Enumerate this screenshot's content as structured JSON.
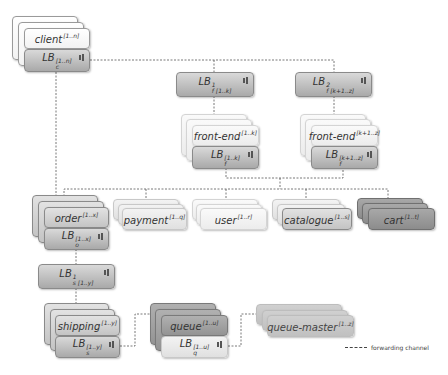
{
  "diagram": {
    "nodes": {
      "client": {
        "name": "client",
        "sup": "[1..n]"
      },
      "lb_client": {
        "name": "LB",
        "sup": "[1..n]",
        "sub": "c"
      },
      "lb_f1": {
        "name": "LB",
        "sup": "1",
        "sub": "f [1..k]"
      },
      "lb_f2": {
        "name": "LB",
        "sup": "2",
        "sub": "f [k+1..z]"
      },
      "frontend1": {
        "name": "front-end",
        "sup": "[1..k]"
      },
      "lb_frontend1": {
        "name": "LB",
        "sup": "[1..k]",
        "sub": "f"
      },
      "frontend2": {
        "name": "front-end",
        "sup": "[k+1..z]"
      },
      "lb_frontend2": {
        "name": "LB",
        "sup": "[k+1..z]",
        "sub": "f"
      },
      "order": {
        "name": "order",
        "sup": "[1..x]"
      },
      "lb_order": {
        "name": "LB",
        "sup": "[1..x]",
        "sub": "o"
      },
      "payment": {
        "name": "payment",
        "sup": "[1..q]"
      },
      "user": {
        "name": "user",
        "sup": "[1..r]"
      },
      "catalogue": {
        "name": "catalogue",
        "sup": "[1..s]"
      },
      "cart": {
        "name": "cart",
        "sup": "[1..t]"
      },
      "lb_s1": {
        "name": "LB",
        "sup": "1",
        "sub": "s [1..y]"
      },
      "shipping": {
        "name": "shipping",
        "sup": "[1..y]"
      },
      "lb_shipping": {
        "name": "LB",
        "sup": "[1..y]",
        "sub": "s"
      },
      "queue": {
        "name": "queue",
        "sup": "[1..u]"
      },
      "lb_queue": {
        "name": "LB",
        "sup": "[1..u]",
        "sub": "q"
      },
      "queue_master": {
        "name": "queue-master",
        "sup": "[1..z]"
      }
    },
    "legend": {
      "label": "forwarding channel"
    },
    "colors": {
      "line": "#555555",
      "lb": "#b8b8b8",
      "cart": "#999999",
      "queue": "#a0a0a0"
    }
  }
}
